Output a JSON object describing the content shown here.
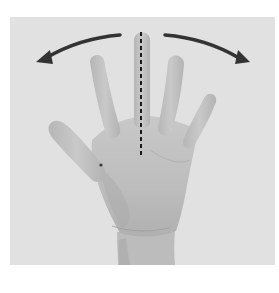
{
  "figure": {
    "annotations": {
      "midline": {
        "style": "dashed",
        "color": "#1a1a1a",
        "x": 141,
        "y_start": 32,
        "y_end": 156
      },
      "arrows": [
        {
          "name": "left-arrow",
          "direction": "outward-left",
          "color": "#333333"
        },
        {
          "name": "right-arrow",
          "direction": "outward-right",
          "color": "#333333"
        }
      ]
    },
    "colors": {
      "page_background": "#ffffff",
      "photo_background": "#e1e1e1",
      "skin_light": "#c6c6c6",
      "skin_mid": "#b4b4b4",
      "skin_shadow": "#9a9a9a"
    }
  }
}
